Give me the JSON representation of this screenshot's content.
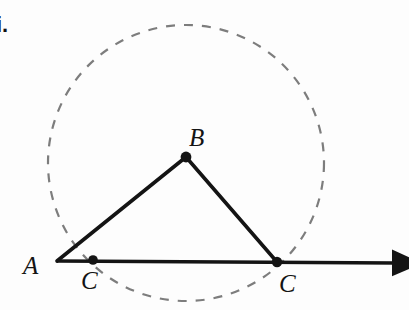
{
  "figure": {
    "list_marker": "i.",
    "canvas": {
      "width": 409,
      "height": 310,
      "background": "#fdfdfd"
    },
    "colors": {
      "stroke": "#141414",
      "circle_dash": "#7d7d7d",
      "label": "#141414"
    },
    "circle": {
      "name": "dashed-circle",
      "center_x": 186,
      "center_y": 163,
      "radius": 138,
      "style": "dashed",
      "dash_pattern": "9 9",
      "stroke_width": 2.2,
      "color": "#7d7d7d"
    },
    "ray": {
      "name": "ray-A-through-C",
      "start_x": 57,
      "start_y": 261,
      "end_x": 395,
      "end_y": 263,
      "stroke_width": 3.4,
      "arrowhead": true
    },
    "segments": [
      {
        "name": "segment-AB",
        "x1": 57,
        "y1": 261,
        "x2": 186,
        "y2": 157,
        "stroke_width": 3.6
      },
      {
        "name": "segment-BC",
        "x1": 186,
        "y1": 157,
        "x2": 277,
        "y2": 262,
        "stroke_width": 3.6
      }
    ],
    "points": [
      {
        "name": "point-A",
        "label": "A",
        "x": 57,
        "y": 261,
        "has_dot": false,
        "dot_radius": 0,
        "label_x": 23,
        "label_y": 253
      },
      {
        "name": "point-B",
        "label": "B",
        "x": 186,
        "y": 157,
        "has_dot": true,
        "dot_radius": 5.4,
        "label_x": 189,
        "label_y": 125
      },
      {
        "name": "point-C-left",
        "label": "C",
        "x": 93,
        "y": 260,
        "has_dot": true,
        "dot_radius": 4.8,
        "label_x": 81,
        "label_y": 268
      },
      {
        "name": "point-C-right",
        "label": "C",
        "x": 277,
        "y": 262,
        "has_dot": true,
        "dot_radius": 5.2,
        "label_x": 279,
        "label_y": 271
      }
    ]
  }
}
